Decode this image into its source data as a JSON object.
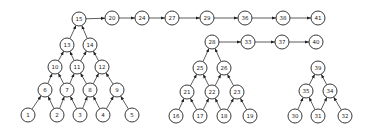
{
  "diagram": {
    "nodes": [
      {
        "id": "1",
        "label": "1"
      },
      {
        "id": "2",
        "label": "2"
      },
      {
        "id": "3",
        "label": "3"
      },
      {
        "id": "4",
        "label": "4"
      },
      {
        "id": "5",
        "label": "5"
      },
      {
        "id": "6",
        "label": "6"
      },
      {
        "id": "7",
        "label": "7"
      },
      {
        "id": "8",
        "label": "8"
      },
      {
        "id": "9",
        "label": "9"
      },
      {
        "id": "10",
        "label": "10"
      },
      {
        "id": "11",
        "label": "11"
      },
      {
        "id": "12",
        "label": "12"
      },
      {
        "id": "13",
        "label": "13"
      },
      {
        "id": "14",
        "label": "14"
      },
      {
        "id": "15",
        "label": "15"
      },
      {
        "id": "20",
        "label": "20"
      },
      {
        "id": "24",
        "label": "24"
      },
      {
        "id": "27",
        "label": "27"
      },
      {
        "id": "29",
        "label": "29"
      },
      {
        "id": "36",
        "label": "36"
      },
      {
        "id": "38",
        "label": "38"
      },
      {
        "id": "41",
        "label": "41"
      },
      {
        "id": "16",
        "label": "16"
      },
      {
        "id": "17",
        "label": "17"
      },
      {
        "id": "18",
        "label": "18"
      },
      {
        "id": "19",
        "label": "19"
      },
      {
        "id": "21",
        "label": "21"
      },
      {
        "id": "22",
        "label": "22"
      },
      {
        "id": "23",
        "label": "23"
      },
      {
        "id": "25",
        "label": "25"
      },
      {
        "id": "26",
        "label": "26"
      },
      {
        "id": "28",
        "label": "28"
      },
      {
        "id": "33",
        "label": "33"
      },
      {
        "id": "37",
        "label": "37"
      },
      {
        "id": "40",
        "label": "40"
      },
      {
        "id": "30",
        "label": "30"
      },
      {
        "id": "31",
        "label": "31"
      },
      {
        "id": "32",
        "label": "32"
      },
      {
        "id": "35",
        "label": "35"
      },
      {
        "id": "34",
        "label": "34"
      },
      {
        "id": "39",
        "label": "39"
      }
    ],
    "edges": [
      [
        "1",
        "6"
      ],
      [
        "2",
        "6"
      ],
      [
        "2",
        "7"
      ],
      [
        "3",
        "7"
      ],
      [
        "3",
        "8"
      ],
      [
        "4",
        "8"
      ],
      [
        "4",
        "9"
      ],
      [
        "5",
        "9"
      ],
      [
        "6",
        "10"
      ],
      [
        "7",
        "10"
      ],
      [
        "7",
        "11"
      ],
      [
        "8",
        "11"
      ],
      [
        "8",
        "12"
      ],
      [
        "9",
        "12"
      ],
      [
        "10",
        "13"
      ],
      [
        "11",
        "13"
      ],
      [
        "11",
        "14"
      ],
      [
        "12",
        "14"
      ],
      [
        "13",
        "15"
      ],
      [
        "14",
        "15"
      ],
      [
        "15",
        "20"
      ],
      [
        "20",
        "24"
      ],
      [
        "24",
        "27"
      ],
      [
        "27",
        "29"
      ],
      [
        "29",
        "36"
      ],
      [
        "36",
        "38"
      ],
      [
        "38",
        "41"
      ],
      [
        "16",
        "21"
      ],
      [
        "17",
        "21"
      ],
      [
        "17",
        "22"
      ],
      [
        "18",
        "22"
      ],
      [
        "18",
        "23"
      ],
      [
        "19",
        "23"
      ],
      [
        "21",
        "25"
      ],
      [
        "22",
        "25"
      ],
      [
        "22",
        "26"
      ],
      [
        "23",
        "26"
      ],
      [
        "25",
        "28"
      ],
      [
        "26",
        "28"
      ],
      [
        "28",
        "33"
      ],
      [
        "33",
        "37"
      ],
      [
        "37",
        "40"
      ],
      [
        "30",
        "35"
      ],
      [
        "31",
        "35"
      ],
      [
        "31",
        "34"
      ],
      [
        "32",
        "34"
      ],
      [
        "35",
        "39"
      ],
      [
        "34",
        "39"
      ]
    ]
  }
}
